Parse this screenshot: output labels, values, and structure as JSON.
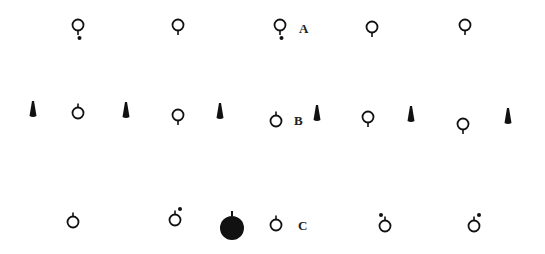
{
  "figure": {
    "rows": [
      {
        "label": "A",
        "label_pos": [
          299,
          21
        ],
        "items": [
          {
            "type": "ring",
            "x": 78,
            "y": 25,
            "stem": "down",
            "dot": "below"
          },
          {
            "type": "ring",
            "x": 178,
            "y": 25,
            "stem": "down",
            "dot": null
          },
          {
            "type": "ring",
            "x": 280,
            "y": 25,
            "stem": "down",
            "dot": "below"
          },
          {
            "type": "ring",
            "x": 372,
            "y": 27,
            "stem": "down",
            "dot": null
          },
          {
            "type": "ring",
            "x": 465,
            "y": 25,
            "stem": "down",
            "dot": null
          }
        ]
      },
      {
        "label": "B",
        "label_pos": [
          294,
          113
        ],
        "items": [
          {
            "type": "cone",
            "x": 33,
            "y": 110
          },
          {
            "type": "ring",
            "x": 78,
            "y": 113,
            "stem": "up",
            "dot": null
          },
          {
            "type": "cone",
            "x": 126,
            "y": 111
          },
          {
            "type": "ring",
            "x": 178,
            "y": 115,
            "stem": "down",
            "dot": null
          },
          {
            "type": "cone",
            "x": 220,
            "y": 112
          },
          {
            "type": "ring",
            "x": 276,
            "y": 121,
            "stem": "up",
            "dot": null
          },
          {
            "type": "cone",
            "x": 317,
            "y": 114
          },
          {
            "type": "ring",
            "x": 368,
            "y": 117,
            "stem": "down",
            "dot": null
          },
          {
            "type": "cone",
            "x": 411,
            "y": 115
          },
          {
            "type": "ring",
            "x": 463,
            "y": 124,
            "stem": "down",
            "dot": null
          },
          {
            "type": "cone",
            "x": 508,
            "y": 117
          }
        ]
      },
      {
        "label": "C",
        "label_pos": [
          298,
          218
        ],
        "items": [
          {
            "type": "ring",
            "x": 73,
            "y": 222,
            "stem": "up",
            "dot": null
          },
          {
            "type": "ring",
            "x": 175,
            "y": 220,
            "stem": "up",
            "dot": "upper-right"
          },
          {
            "type": "solid",
            "x": 232,
            "y": 227,
            "stem": "up"
          },
          {
            "type": "ring",
            "x": 276,
            "y": 225,
            "stem": "up",
            "dot": null
          },
          {
            "type": "ring",
            "x": 385,
            "y": 226,
            "stem": "up",
            "dot": "upper-left"
          },
          {
            "type": "ring",
            "x": 474,
            "y": 226,
            "stem": "up",
            "dot": "upper-right"
          }
        ]
      }
    ],
    "colors": {
      "ink": "#111111",
      "background": "#ffffff"
    }
  }
}
